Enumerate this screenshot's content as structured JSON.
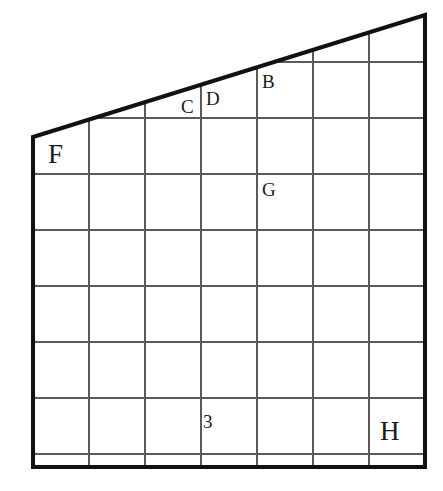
{
  "figure": {
    "kind": "geometry-grid-figure",
    "canvas": {
      "width": 443,
      "height": 491
    },
    "colors": {
      "background": "#ffffff",
      "outline": "#111111",
      "gridline": "#5a5a5a",
      "text": "#1a1a1a"
    },
    "stroke_widths": {
      "outline": 4,
      "gridline": 1.2
    },
    "outline_points": "33,137 425,15 425,467 33,467",
    "grid": {
      "columns": 7,
      "rows": 7,
      "cell_size": 56,
      "x_lines": [
        33,
        89,
        145,
        201,
        257,
        313,
        369,
        425
      ],
      "y_lines": [
        62,
        118,
        174,
        230,
        286,
        342,
        398,
        454,
        467
      ]
    },
    "shape_vertices": [
      {
        "name": "F",
        "x": 33,
        "y": 137
      },
      {
        "name": "top-right",
        "x": 425,
        "y": 15
      },
      {
        "name": "H",
        "x": 425,
        "y": 467
      },
      {
        "name": "bottom-left",
        "x": 33,
        "y": 467
      }
    ],
    "slant_line": {
      "x1": 33,
      "y1": 137,
      "x2": 425,
      "y2": 15
    }
  },
  "labels": [
    {
      "id": "label-b",
      "text": "B",
      "x": 262,
      "y": 72,
      "size": "label-md"
    },
    {
      "id": "label-c",
      "text": "C",
      "x": 181,
      "y": 97,
      "size": "label-md"
    },
    {
      "id": "label-d",
      "text": "D",
      "x": 206,
      "y": 89,
      "size": "label-md"
    },
    {
      "id": "label-f",
      "text": "F",
      "x": 48,
      "y": 141,
      "size": "label-lg"
    },
    {
      "id": "label-g",
      "text": "G",
      "x": 262,
      "y": 180,
      "size": "label-md"
    },
    {
      "id": "label-3",
      "text": "3",
      "x": 203,
      "y": 412,
      "size": "label-md"
    },
    {
      "id": "label-h",
      "text": "H",
      "x": 380,
      "y": 418,
      "size": "label-lg"
    }
  ]
}
